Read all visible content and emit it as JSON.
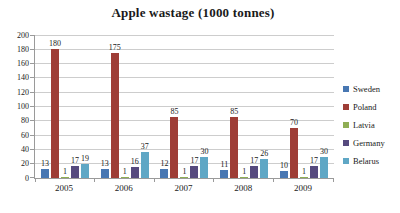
{
  "chart_data": {
    "type": "bar",
    "title": "Apple wastage (1000 tonnes)",
    "categories": [
      "2005",
      "2006",
      "2007",
      "2008",
      "2009"
    ],
    "series": [
      {
        "name": "Sweden",
        "color": "#4877B2",
        "values": [
          13,
          13,
          12,
          11,
          10
        ]
      },
      {
        "name": "Poland",
        "color": "#9E3D36",
        "values": [
          180,
          175,
          85,
          85,
          70
        ]
      },
      {
        "name": "Latvia",
        "color": "#8FAE54",
        "values": [
          1,
          1,
          1,
          1,
          1
        ]
      },
      {
        "name": "Germany",
        "color": "#564A7E",
        "values": [
          17,
          16,
          17,
          17,
          17
        ]
      },
      {
        "name": "Belarus",
        "color": "#5FA7C5",
        "values": [
          19,
          37,
          30,
          26,
          30
        ]
      }
    ],
    "ylim": [
      0,
      200
    ],
    "yticks": [
      0,
      20,
      40,
      60,
      80,
      100,
      120,
      140,
      160,
      180,
      200
    ],
    "grid": true,
    "legend_position": "right",
    "data_labels": true,
    "xlabel": "",
    "ylabel": ""
  },
  "colors": {
    "gridline": "#CDCDCD",
    "axis": "#9A9A9A",
    "text": "#1A1A1A",
    "background": "#FFFFFF"
  }
}
